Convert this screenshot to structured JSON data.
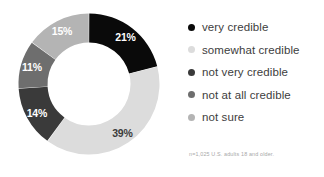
{
  "chart_data": {
    "type": "pie",
    "variant": "donut",
    "title": "",
    "subtitle": "",
    "xlabel": "",
    "ylabel": "",
    "start_angle_deg": 0,
    "direction": "clockwise",
    "legend_position": "right",
    "grid": false,
    "categories": [
      "very credible",
      "somewhat credible",
      "not very credible",
      "not at all credible",
      "not sure"
    ],
    "values": [
      21,
      39,
      14,
      11,
      15
    ],
    "value_labels": [
      "21%",
      "39%",
      "14%",
      "11%",
      "15%"
    ],
    "colors": [
      "#0a0a0a",
      "#dcdcdc",
      "#3a3a3a",
      "#6e6e6e",
      "#b4b4b4"
    ],
    "label_text_colors": [
      "#ffffff",
      "#3b3b3b",
      "#ffffff",
      "#ffffff",
      "#ffffff"
    ],
    "total": 100,
    "units": "percent"
  },
  "legend": {
    "items": [
      {
        "label": "very credible",
        "color": "#0a0a0a",
        "value_label": "21%"
      },
      {
        "label": "somewhat credible",
        "color": "#dcdcdc",
        "value_label": "39%"
      },
      {
        "label": "not very credible",
        "color": "#3a3a3a",
        "value_label": "14%"
      },
      {
        "label": "not at all credible",
        "color": "#6e6e6e",
        "value_label": "11%"
      },
      {
        "label": "not sure",
        "color": "#b4b4b4",
        "value_label": "15%"
      }
    ]
  },
  "footnote": {
    "text": "n=1,025 U.S. adults 18 and older."
  }
}
